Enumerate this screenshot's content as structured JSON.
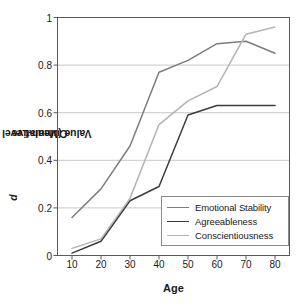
{
  "chart_data": {
    "type": "line",
    "title": "",
    "xlabel": "Age",
    "ylabel": "Cumulative d Value (Mean-Level Change)",
    "ylabel_parts": {
      "pre": "Cumulative ",
      "italic": "d",
      "post": " Value (Mean-Level Change)"
    },
    "x": [
      10,
      20,
      30,
      40,
      50,
      60,
      70,
      80
    ],
    "xtick_labels": [
      "10",
      "20",
      "30",
      "40",
      "50",
      "60",
      "70",
      "80"
    ],
    "ytick_labels": [
      "0",
      "0.2",
      "0.4",
      "0.6",
      "0.8",
      "1"
    ],
    "ytick_values": [
      0,
      0.2,
      0.4,
      0.6,
      0.8,
      1
    ],
    "xlim": [
      5,
      85
    ],
    "ylim": [
      0,
      1
    ],
    "grid": "horizontal",
    "legend_position": "inside-bottom-right",
    "series": [
      {
        "name": "Emotional Stability",
        "color": "#7d7d7d",
        "values": [
          0.16,
          0.28,
          0.46,
          0.77,
          0.82,
          0.89,
          0.9,
          0.85
        ]
      },
      {
        "name": "Agreeableness",
        "color": "#3c3c3c",
        "values": [
          0.01,
          0.06,
          0.23,
          0.29,
          0.59,
          0.63,
          0.63,
          0.63
        ]
      },
      {
        "name": "Conscientiousness",
        "color": "#b4b4b4",
        "values": [
          0.03,
          0.07,
          0.24,
          0.55,
          0.65,
          0.71,
          0.93,
          0.96
        ]
      }
    ]
  },
  "axes": {
    "frame_color": "#5a5a5a",
    "grid_color": "#c8c8c8"
  }
}
